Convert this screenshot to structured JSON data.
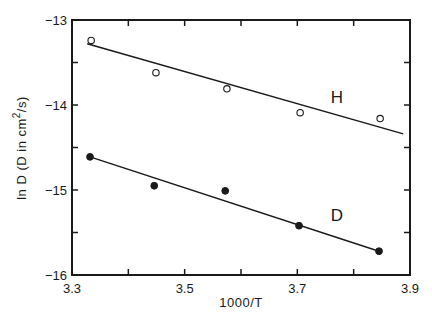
{
  "chart_data": {
    "type": "scatter",
    "title": "",
    "xlabel": "1000/T",
    "ylabel": "ln D  (D in cm²/s)",
    "ylabel_parts": {
      "main": "ln D  (D in cm",
      "sup": "2",
      "tail": "/s)"
    },
    "xlim": [
      3.3,
      3.9
    ],
    "ylim": [
      -16,
      -13
    ],
    "xticks": [
      3.3,
      3.5,
      3.7,
      3.9
    ],
    "xtick_labels": [
      "3.3",
      "3.5",
      "3.7",
      "3.9"
    ],
    "x_minor_ticks": [
      3.4,
      3.6,
      3.8
    ],
    "yticks": [
      -13,
      -14,
      -15,
      -16
    ],
    "ytick_labels": [
      "-13",
      "-14",
      "-15",
      "-16"
    ],
    "y_minor_ticks": [
      -13.5,
      -14.5,
      -15.5
    ],
    "grid": false,
    "legend": "none (series labeled inline)",
    "series": [
      {
        "name": "H",
        "marker": "open-circle",
        "x": [
          3.334,
          3.449,
          3.575,
          3.705,
          3.847
        ],
        "y": [
          -13.24,
          -13.62,
          -13.81,
          -14.09,
          -14.16
        ],
        "fit_line": {
          "x": [
            3.327,
            3.888
          ],
          "y": [
            -13.28,
            -14.34
          ]
        },
        "label_position": {
          "x": 3.77,
          "y": -13.98
        }
      },
      {
        "name": "D",
        "marker": "filled-circle",
        "x": [
          3.332,
          3.446,
          3.572,
          3.703,
          3.845
        ],
        "y": [
          -14.61,
          -14.95,
          -15.01,
          -15.42,
          -15.72
        ],
        "fit_line": {
          "x": [
            3.332,
            3.845
          ],
          "y": [
            -14.61,
            -15.72
          ]
        },
        "label_position": {
          "x": 3.77,
          "y": -15.37
        }
      }
    ]
  }
}
